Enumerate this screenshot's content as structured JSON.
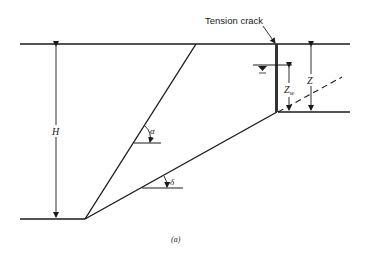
{
  "figure": {
    "caption": "(a)",
    "labels": {
      "tension_crack": "Tension crack",
      "H": "H",
      "Z": "Z",
      "Zw_main": "Z",
      "Zw_sub": "w",
      "alpha": "α",
      "delta": "δ"
    },
    "colors": {
      "line": "#1a1a1a",
      "background": "#ffffff"
    }
  }
}
